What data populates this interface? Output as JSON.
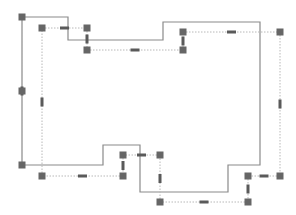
{
  "colors": {
    "outline": "#8a8a8a",
    "guide": "#b8b8b8",
    "handle": "#666666",
    "midhandle": "#5a5a5a",
    "background": "#ffffff"
  },
  "outline_polygon": [
    [
      22,
      17
    ],
    [
      68,
      17
    ],
    [
      68,
      40
    ],
    [
      163,
      40
    ],
    [
      163,
      22
    ],
    [
      260,
      22
    ],
    [
      260,
      165
    ],
    [
      228,
      165
    ],
    [
      228,
      192
    ],
    [
      140,
      192
    ],
    [
      140,
      145
    ],
    [
      103,
      145
    ],
    [
      103,
      165
    ],
    [
      22,
      165
    ]
  ],
  "guides": [
    {
      "from": [
        22,
        17
      ],
      "to": [
        22,
        165
      ],
      "mid": "v"
    },
    {
      "from": [
        42,
        28
      ],
      "to": [
        87,
        28
      ],
      "mid": "h"
    },
    {
      "from": [
        87,
        28
      ],
      "to": [
        87,
        50
      ],
      "mid": "v"
    },
    {
      "from": [
        87,
        50
      ],
      "to": [
        183,
        50
      ],
      "mid": "h"
    },
    {
      "from": [
        183,
        50
      ],
      "to": [
        183,
        32
      ],
      "mid": "v"
    },
    {
      "from": [
        183,
        32
      ],
      "to": [
        280,
        32
      ],
      "mid": "h"
    },
    {
      "from": [
        280,
        32
      ],
      "to": [
        280,
        176
      ],
      "mid": "v"
    },
    {
      "from": [
        280,
        176
      ],
      "to": [
        248,
        176
      ],
      "mid": "h"
    },
    {
      "from": [
        248,
        176
      ],
      "to": [
        248,
        202
      ],
      "mid": "v"
    },
    {
      "from": [
        248,
        202
      ],
      "to": [
        160,
        202
      ],
      "mid": "h"
    },
    {
      "from": [
        160,
        202
      ],
      "to": [
        160,
        155
      ],
      "mid": "v"
    },
    {
      "from": [
        160,
        155
      ],
      "to": [
        123,
        155
      ],
      "mid": "h"
    },
    {
      "from": [
        123,
        155
      ],
      "to": [
        123,
        176
      ],
      "mid": "v"
    },
    {
      "from": [
        123,
        176
      ],
      "to": [
        42,
        176
      ],
      "mid": "h"
    },
    {
      "from": [
        42,
        176
      ],
      "to": [
        42,
        28
      ],
      "mid": "v"
    }
  ],
  "corner_handles": [
    [
      22,
      17
    ],
    [
      22,
      91
    ],
    [
      22,
      165
    ],
    [
      42,
      28
    ],
    [
      87,
      28
    ],
    [
      87,
      50
    ],
    [
      183,
      50
    ],
    [
      183,
      32
    ],
    [
      280,
      32
    ],
    [
      280,
      176
    ],
    [
      248,
      176
    ],
    [
      248,
      202
    ],
    [
      160,
      202
    ],
    [
      160,
      155
    ],
    [
      123,
      155
    ],
    [
      123,
      176
    ],
    [
      42,
      176
    ]
  ]
}
